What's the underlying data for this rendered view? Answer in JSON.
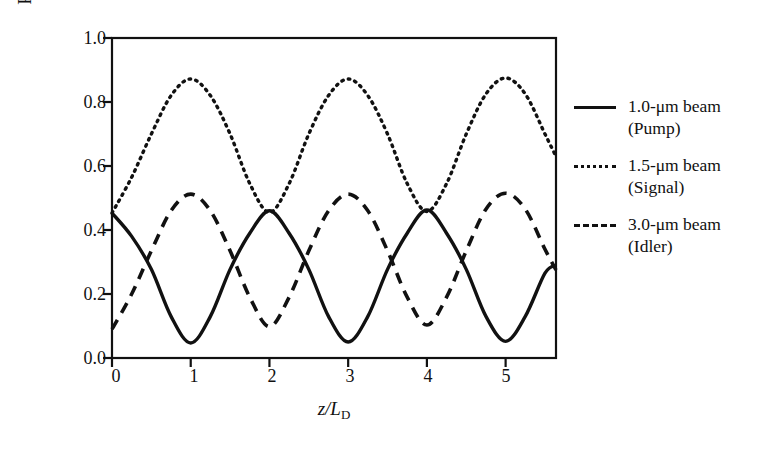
{
  "axes": {
    "ylabel": "Relative photon numbers",
    "xlabel_main": "z/L",
    "xlabel_sub": "D",
    "ytick_labels": [
      "1.0",
      "0.8",
      "0.6",
      "0.4",
      "0.2",
      "0.0"
    ],
    "xtick_labels": [
      "0",
      "1",
      "2",
      "3",
      "4",
      "5"
    ]
  },
  "legend": {
    "entries": [
      {
        "style": "solid",
        "line1": "1.0-μm beam",
        "line2": "(Pump)"
      },
      {
        "style": "dotted",
        "line1": "1.5-μm beam",
        "line2": "(Signal)"
      },
      {
        "style": "dashed",
        "line1": "3.0-μm beam",
        "line2": "(Idler)"
      }
    ]
  },
  "chart_data": {
    "type": "line",
    "title": "",
    "xlabel": "z/L_D",
    "ylabel": "Relative photon numbers",
    "xlim": [
      0,
      5.64
    ],
    "ylim": [
      0.0,
      1.0
    ],
    "xticks": [
      0,
      1,
      2,
      3,
      4,
      5
    ],
    "yticks": [
      0.0,
      0.2,
      0.4,
      0.6,
      0.8,
      1.0
    ],
    "grid": false,
    "legend_position": "right",
    "period": 2.0,
    "x": [
      0,
      0.25,
      0.5,
      0.75,
      1.0,
      1.25,
      1.5,
      1.75,
      2.0,
      2.25,
      2.5,
      2.75,
      3.0,
      3.25,
      3.5,
      3.75,
      4.0,
      4.25,
      4.5,
      4.75,
      5.0,
      5.25,
      5.5,
      5.64
    ],
    "series": [
      {
        "name": "1.0-μm beam (Pump)",
        "style": "solid",
        "min": 0.047,
        "max": 0.46,
        "values": [
          0.453,
          0.38,
          0.277,
          0.13,
          0.047,
          0.13,
          0.277,
          0.39,
          0.46,
          0.39,
          0.277,
          0.13,
          0.05,
          0.13,
          0.277,
          0.39,
          0.463,
          0.39,
          0.277,
          0.13,
          0.052,
          0.13,
          0.265,
          0.29
        ]
      },
      {
        "name": "1.5-μm beam (Signal)",
        "style": "dotted",
        "min": 0.453,
        "max": 0.872,
        "values": [
          0.453,
          0.565,
          0.7,
          0.82,
          0.872,
          0.82,
          0.7,
          0.545,
          0.455,
          0.545,
          0.7,
          0.82,
          0.872,
          0.82,
          0.7,
          0.545,
          0.458,
          0.545,
          0.7,
          0.825,
          0.875,
          0.825,
          0.7,
          0.63
        ]
      },
      {
        "name": "3.0-μm beam (Idler)",
        "style": "dashed",
        "min": 0.095,
        "max": 0.512,
        "values": [
          0.09,
          0.2,
          0.335,
          0.46,
          0.512,
          0.46,
          0.335,
          0.19,
          0.098,
          0.19,
          0.335,
          0.46,
          0.512,
          0.46,
          0.335,
          0.19,
          0.103,
          0.19,
          0.335,
          0.465,
          0.515,
          0.465,
          0.34,
          0.275
        ]
      }
    ]
  },
  "plot_geometry": {
    "left": 112,
    "right": 556,
    "top": 38,
    "bottom": 358
  }
}
